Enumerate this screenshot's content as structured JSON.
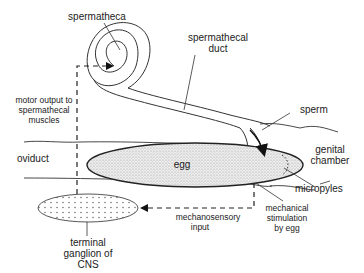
{
  "diagram": {
    "labels": {
      "spermatheca": "spermatheca",
      "spermathecal_duct_1": "spermathecal",
      "spermathecal_duct_2": "duct",
      "sperm": "sperm",
      "genital_chamber_1": "genital",
      "genital_chamber_2": "chamber",
      "oviduct": "oviduct",
      "egg": "egg",
      "micropyles": "micropyles",
      "motor_output_1": "motor output to",
      "motor_output_2": "spermathecal",
      "motor_output_3": "muscles",
      "mechanosensory_1": "mechanosensory",
      "mechanosensory_2": "input",
      "mechanical_stim_1": "mechanical",
      "mechanical_stim_2": "stimulation",
      "mechanical_stim_3": "by egg",
      "ganglion_1": "terminal",
      "ganglion_2": "ganglion of",
      "ganglion_3": "CNS"
    },
    "colors": {
      "line": "#333333",
      "egg_fill": "#e6e6e6",
      "ganglion_fill": "#ffffff"
    }
  }
}
